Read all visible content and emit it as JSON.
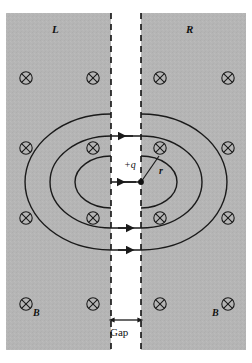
{
  "figure": {
    "type": "physics-diagram",
    "background_color": "#ffffff",
    "plate_color": "#b5b5b5",
    "gap_color": "#ffffff",
    "line_color": "#1a1a1a"
  },
  "labels": {
    "left_region": "L",
    "right_region": "R",
    "charge": "+q",
    "radius": "r",
    "gap": "Gap",
    "b_field_left": "B",
    "b_field_right": "B"
  },
  "icons": {
    "field_into_page": "circle-x-icon",
    "arrow_right": "arrow-right-icon",
    "arrow_left": "arrow-left-icon",
    "dimension_arrow": "double-arrow-icon"
  },
  "geometry": {
    "panel": {
      "x": 6,
      "y": 13,
      "width": 240,
      "height": 337
    },
    "gap": {
      "left_x": 111,
      "right_x": 141,
      "width": 30
    },
    "charge_point": {
      "x": 141,
      "y": 182
    },
    "gap_dimension_y": 320
  },
  "field_markers": {
    "columns": [
      26,
      93,
      160,
      228
    ],
    "rows": [
      78,
      148,
      218,
      304
    ],
    "symbol": "circle-x",
    "count": 16
  },
  "field_loops": [
    {
      "name": "inner-loop",
      "rx": 36,
      "ry": 26,
      "arrow_top": "left",
      "arrow_bottom": "right"
    },
    {
      "name": "middle-loop",
      "rx": 61,
      "ry": 46,
      "arrow_top": "left",
      "arrow_bottom": "right"
    },
    {
      "name": "outer-loop",
      "rx": 86,
      "ry": 68,
      "arrow_top": "left",
      "arrow_bottom": "right"
    }
  ]
}
